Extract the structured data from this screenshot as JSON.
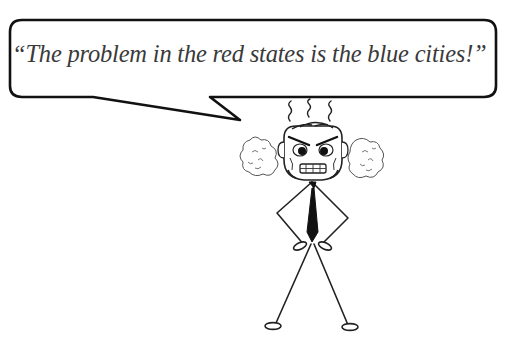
{
  "speech_bubble": {
    "quote": "“The problem in the red states is the blue cities!”"
  },
  "character": {
    "description": "angry stick figure in a necktie, hands on hips, steam from head and smoke from ears"
  },
  "colors": {
    "ink": "#111111",
    "text": "#3a3a3a",
    "background": "#ffffff",
    "smoke": "#555555"
  }
}
